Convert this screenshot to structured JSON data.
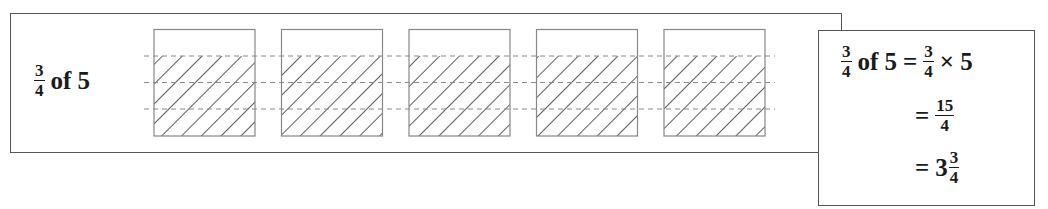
{
  "diagram": {
    "label": {
      "numerator": "3",
      "denominator": "4",
      "rest": "of 5"
    },
    "boxes": {
      "count": 5,
      "parts_per_box": 4,
      "shaded_parts_per_box": 3,
      "stroke_color": "#888888",
      "hatch_color": "#333333",
      "dash_color": "#888888"
    }
  },
  "result": {
    "line1": {
      "lhs_num": "3",
      "lhs_den": "4",
      "lhs_rest": "of 5",
      "eq": "=",
      "rhs_num": "3",
      "rhs_den": "4",
      "rhs_rest": "× 5"
    },
    "line2": {
      "eq": "=",
      "num": "15",
      "den": "4"
    },
    "line3": {
      "eq": "=",
      "whole": "3",
      "num": "3",
      "den": "4"
    }
  }
}
